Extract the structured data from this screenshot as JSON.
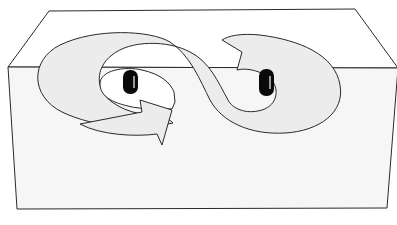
{
  "diagram": {
    "colors": {
      "background": "#ffffff",
      "stroke": "#2a2a2a",
      "path_fill": "#ececec",
      "slab_front": "#f6f6f6",
      "peg": "#0a0a0a"
    },
    "elements": [
      {
        "name": "slab-top-face"
      },
      {
        "name": "slab-front-face"
      },
      {
        "name": "figure-eight-arrow-path"
      },
      {
        "name": "left-peg"
      },
      {
        "name": "right-peg"
      }
    ]
  }
}
